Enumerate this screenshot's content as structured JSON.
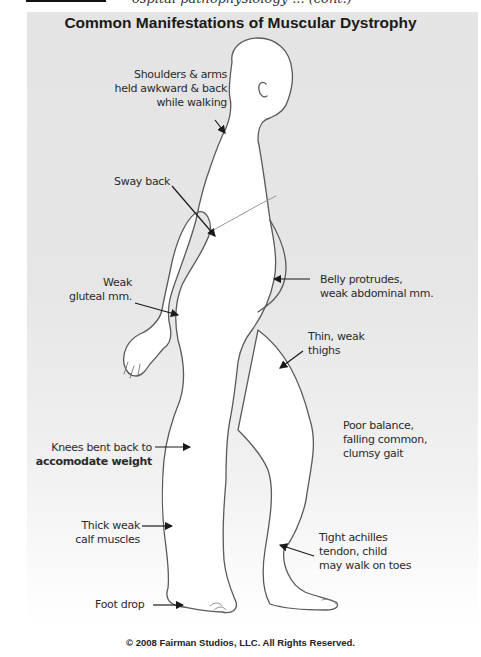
{
  "caption": {
    "partial_text": "ospital pathophysiology ... (cont.)"
  },
  "diagram": {
    "title": "Common Manifestations of Muscular Dystrophy",
    "labels": [
      {
        "id": "shoulders",
        "lines": [
          "Shoulders & arms",
          "held awkward & back",
          "while walking"
        ]
      },
      {
        "id": "sway-back",
        "lines": [
          "Sway back"
        ]
      },
      {
        "id": "gluteal",
        "lines": [
          "Weak",
          "gluteal mm."
        ]
      },
      {
        "id": "belly",
        "lines": [
          "Belly protrudes,",
          "weak abdominal mm."
        ]
      },
      {
        "id": "thighs",
        "lines": [
          "Thin, weak",
          "thighs"
        ]
      },
      {
        "id": "balance",
        "lines": [
          "Poor balance,",
          "falling common,",
          "clumsy gait"
        ]
      },
      {
        "id": "knees",
        "lines": [
          "Knees bent back to",
          "accomodate weight"
        ]
      },
      {
        "id": "calf",
        "lines": [
          "Thick weak",
          "calf muscles"
        ]
      },
      {
        "id": "achilles",
        "lines": [
          "Tight achilles",
          "tendon, child",
          "may walk on toes"
        ]
      },
      {
        "id": "foot-drop",
        "lines": [
          "Foot drop"
        ]
      }
    ],
    "copyright": "© 2008 Fairman Studios, LLC. All Rights Reserved."
  },
  "colors": {
    "panel": "#e5e5e5",
    "outline": "#555555",
    "text": "#2a2a2a"
  }
}
